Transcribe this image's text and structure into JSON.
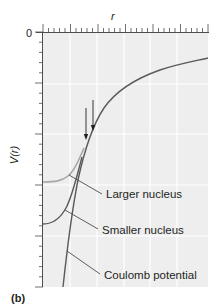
{
  "figure": {
    "panel_label": "(b)",
    "x_axis_label": "r",
    "y_axis_label": "V(r)",
    "y_tick_zero": "0",
    "colors": {
      "plot_background": "#eeeeef",
      "gridline": "#ffffff",
      "axis": "#4d4d4f",
      "curve_dark": "#5a5a5c",
      "curve_light": "#a8a8aa",
      "text": "#231f20"
    },
    "annotations": [
      {
        "label": "Larger nucleus"
      },
      {
        "label": "Smaller nucleus"
      },
      {
        "label": "Coulomb potential"
      }
    ],
    "arrows": [
      {
        "name": "larger-nucleus-radius-arrow"
      },
      {
        "name": "smaller-nucleus-radius-arrow"
      }
    ]
  }
}
